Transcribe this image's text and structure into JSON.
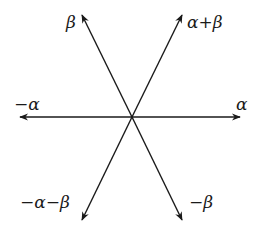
{
  "diagram": {
    "title": "",
    "center": {
      "x": 132,
      "y": 117
    },
    "vectors": [
      {
        "id": "alpha",
        "label": "α",
        "tip": {
          "x": 240,
          "y": 117
        },
        "label_pos": {
          "x": 236,
          "y": 110
        }
      },
      {
        "id": "neg-alpha",
        "label": "−α",
        "tip": {
          "x": 20,
          "y": 117
        },
        "label_pos": {
          "x": 14,
          "y": 110
        }
      },
      {
        "id": "beta",
        "label": "β",
        "tip": {
          "x": 82,
          "y": 15
        },
        "label_pos": {
          "x": 66,
          "y": 28
        }
      },
      {
        "id": "alpha-plus-beta",
        "label": "α+β",
        "tip": {
          "x": 182,
          "y": 15
        },
        "label_pos": {
          "x": 187,
          "y": 28
        }
      },
      {
        "id": "neg-beta",
        "label": "−β",
        "tip": {
          "x": 182,
          "y": 220
        },
        "label_pos": {
          "x": 189,
          "y": 208
        }
      },
      {
        "id": "neg-alpha-minus-beta",
        "label": "−α−β",
        "tip": {
          "x": 82,
          "y": 220
        },
        "label_pos": {
          "x": 20,
          "y": 208
        }
      }
    ],
    "line_color": "#1a1a1a"
  }
}
